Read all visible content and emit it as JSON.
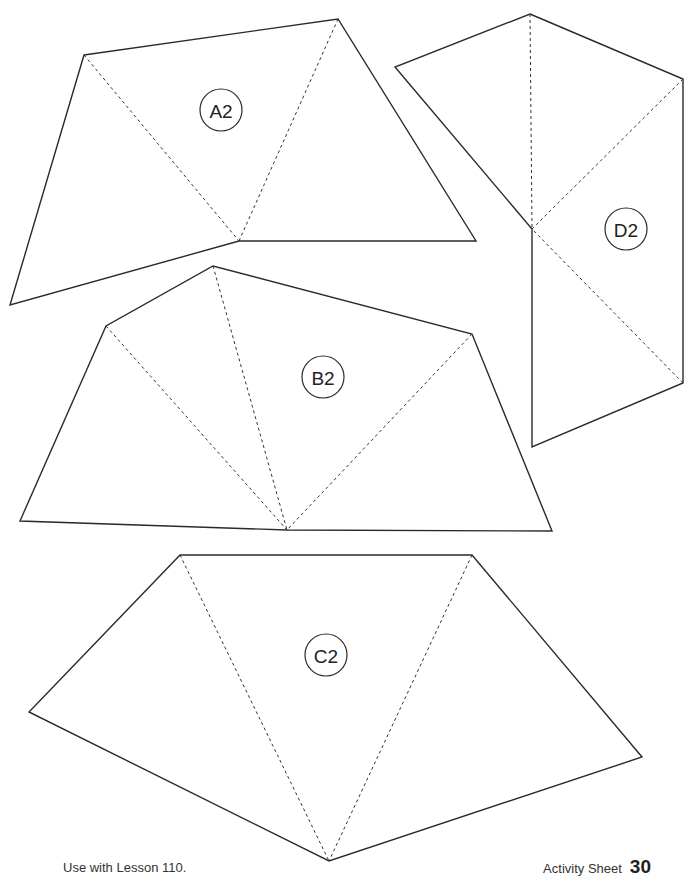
{
  "shapes": [
    {
      "id": "A2",
      "label": "A2",
      "outline": "84,55 338,19 476,241 239,241 10,305",
      "folds": [
        "84,55 239,241",
        "338,19 239,241"
      ],
      "badge": {
        "cx": 221,
        "cy": 110,
        "r": 21
      }
    },
    {
      "id": "B2",
      "label": "B2",
      "outline": "20,521 106,326 213,266 472,334 552,531 287,530",
      "folds": [
        "106,326 287,530",
        "213,266 287,530",
        "472,334 287,530"
      ],
      "badge": {
        "cx": 323,
        "cy": 377,
        "r": 21
      }
    },
    {
      "id": "C2",
      "label": "C2",
      "outline": "180,555 472,555 642,757 329,861 29,712",
      "folds": [
        "180,555 329,861",
        "472,555 329,861"
      ],
      "badge": {
        "cx": 326,
        "cy": 655,
        "r": 21
      }
    },
    {
      "id": "D2",
      "label": "D2",
      "outline": "530,14 683,79 683,383 532,447 532,229 395,67",
      "folds": [
        "530,14 532,229",
        "683,79 532,229",
        "683,383 532,229"
      ],
      "badge": {
        "cx": 626,
        "cy": 229,
        "r": 21
      }
    }
  ],
  "footer": {
    "left_text": "Use with Lesson 110.",
    "right_label": "Activity Sheet",
    "right_number": "30"
  },
  "colors": {
    "line": "#2a2a2a",
    "background": "#ffffff"
  }
}
